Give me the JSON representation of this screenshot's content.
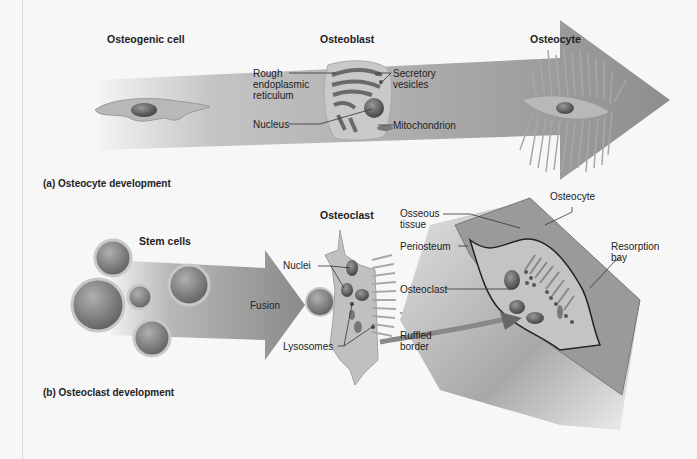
{
  "figure": {
    "panel_a": {
      "caption": "(a) Osteocyte development",
      "stages": [
        "Osteogenic cell",
        "Osteoblast",
        "Osteocyte"
      ],
      "osteoblast_labels": {
        "rough_er": "Rough\nendoplasmic\nreticulum",
        "nucleus": "Nucleus",
        "secretory_vesicles": "Secretory\nvesicles",
        "mitochondrion": "Mitochondrion"
      }
    },
    "panel_b": {
      "caption": "(b) Osteoclast development",
      "stem_cells": "Stem cells",
      "fusion": "Fusion",
      "osteoclast_title": "Osteoclast",
      "osteoclast_labels": {
        "nuclei": "Nuclei",
        "lysosomes": "Lysosomes",
        "ruffled_border": "Ruffled\nborder"
      },
      "bone_labels": {
        "osteocyte": "Osteocyte",
        "osseous_tissue": "Osseous\ntissue",
        "periosteum": "Periosteum",
        "osteoclast": "Osteoclast",
        "resorption_bay": "Resorption\nbay"
      }
    },
    "colors": {
      "background": "#f7f7f7",
      "arrow": "#9a9a9a",
      "cell": "#b5b5b5",
      "nucleus": "#6e6e6e",
      "bone": "#8f8f8f"
    }
  }
}
